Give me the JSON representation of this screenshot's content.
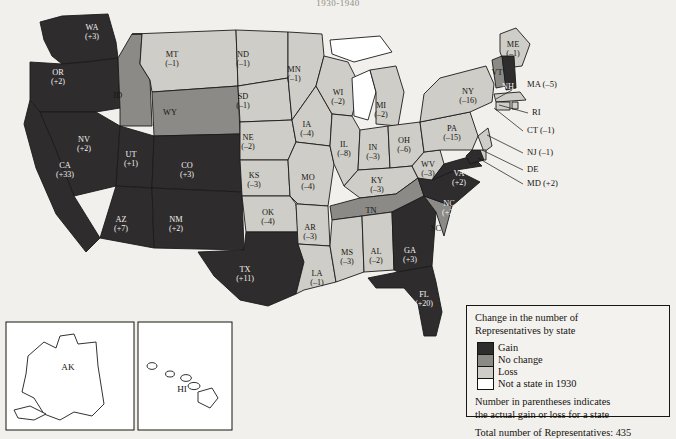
{
  "title": "1930-1940",
  "legend": {
    "heading_line1": "Change in the number of",
    "heading_line2": "Representatives by state",
    "items": [
      {
        "key": "gain",
        "label": "Gain",
        "color": "#2e2c2c"
      },
      {
        "key": "nochange",
        "label": "No change",
        "color": "#8b8a87"
      },
      {
        "key": "loss",
        "label": "Loss",
        "color": "#cfcdc8"
      },
      {
        "key": "notstate",
        "label": "Not a state in 1930",
        "color": "#ffffff"
      }
    ],
    "note_line1": "Number in parentheses indicates",
    "note_line2": "the actual gain or loss for a state",
    "total": "Total number of Representatives: 435"
  },
  "insets": [
    {
      "name": "AK",
      "label": "AK"
    },
    {
      "name": "HI",
      "label": "HI"
    }
  ],
  "chart_data": {
    "type": "map",
    "title": "Change in the number of Representatives by state",
    "total_representatives": 435,
    "categories": [
      "Gain",
      "No change",
      "Loss",
      "Not a state in 1930"
    ],
    "states": [
      {
        "code": "WA",
        "value": 3,
        "label": "WA",
        "num": "(+3)",
        "cat": "gain",
        "x": 92,
        "y": 30
      },
      {
        "code": "OR",
        "value": 2,
        "label": "OR",
        "num": "(+2)",
        "cat": "gain",
        "x": 58,
        "y": 75
      },
      {
        "code": "CA",
        "value": 33,
        "label": "CA",
        "num": "(+33)",
        "cat": "gain",
        "x": 65,
        "y": 168
      },
      {
        "code": "NV",
        "value": 2,
        "label": "NV",
        "num": "(+2)",
        "cat": "gain",
        "x": 84,
        "y": 142
      },
      {
        "code": "ID",
        "value": 0,
        "label": "ID",
        "num": "",
        "cat": "nochange",
        "x": 118,
        "y": 98
      },
      {
        "code": "MT",
        "value": -1,
        "label": "MT",
        "num": "(–1)",
        "cat": "loss",
        "x": 172,
        "y": 57
      },
      {
        "code": "WY",
        "value": 0,
        "label": "WY",
        "num": "",
        "cat": "nochange",
        "x": 170,
        "y": 115
      },
      {
        "code": "UT",
        "value": 1,
        "label": "UT",
        "num": "(+1)",
        "cat": "gain",
        "x": 131,
        "y": 157
      },
      {
        "code": "CO",
        "value": 3,
        "label": "CO",
        "num": "(+3)",
        "cat": "gain",
        "x": 187,
        "y": 168
      },
      {
        "code": "AZ",
        "value": 7,
        "label": "AZ",
        "num": "(+7)",
        "cat": "gain",
        "x": 121,
        "y": 222
      },
      {
        "code": "NM",
        "value": 2,
        "label": "NM",
        "num": "(+2)",
        "cat": "gain",
        "x": 176,
        "y": 222
      },
      {
        "code": "ND",
        "value": -1,
        "label": "ND",
        "num": "(–1)",
        "cat": "loss",
        "x": 243,
        "y": 57
      },
      {
        "code": "SD",
        "value": -1,
        "label": "SD",
        "num": "(–1)",
        "cat": "loss",
        "x": 243,
        "y": 99
      },
      {
        "code": "NE",
        "value": -2,
        "label": "NE",
        "num": "(–2)",
        "cat": "loss",
        "x": 248,
        "y": 140
      },
      {
        "code": "KS",
        "value": -3,
        "label": "KS",
        "num": "(–3)",
        "cat": "loss",
        "x": 254,
        "y": 178
      },
      {
        "code": "OK",
        "value": -4,
        "label": "OK",
        "num": "(–4)",
        "cat": "loss",
        "x": 268,
        "y": 215
      },
      {
        "code": "TX",
        "value": 11,
        "label": "TX",
        "num": "(+11)",
        "cat": "gain",
        "x": 245,
        "y": 272
      },
      {
        "code": "MN",
        "value": -1,
        "label": "MN",
        "num": "(–1)",
        "cat": "loss",
        "x": 294,
        "y": 72
      },
      {
        "code": "IA",
        "value": -4,
        "label": "IA",
        "num": "(–4)",
        "cat": "loss",
        "x": 307,
        "y": 127
      },
      {
        "code": "MO",
        "value": -4,
        "label": "MO",
        "num": "(–4)",
        "cat": "loss",
        "x": 308,
        "y": 180
      },
      {
        "code": "AR",
        "value": -3,
        "label": "AR",
        "num": "(–3)",
        "cat": "loss",
        "x": 310,
        "y": 230
      },
      {
        "code": "LA",
        "value": -1,
        "label": "LA",
        "num": "(–1)",
        "cat": "loss",
        "x": 317,
        "y": 276
      },
      {
        "code": "WI",
        "value": -2,
        "label": "WI",
        "num": "(–2)",
        "cat": "loss",
        "x": 338,
        "y": 95
      },
      {
        "code": "MI",
        "value": -2,
        "label": "MI",
        "num": "(–2)",
        "cat": "loss",
        "x": 381,
        "y": 108
      },
      {
        "code": "IL",
        "value": -8,
        "label": "IL",
        "num": "(–8)",
        "cat": "loss",
        "x": 344,
        "y": 147
      },
      {
        "code": "IN",
        "value": -3,
        "label": "IN",
        "num": "(–3)",
        "cat": "loss",
        "x": 373,
        "y": 150
      },
      {
        "code": "OH",
        "value": -6,
        "label": "OH",
        "num": "(–6)",
        "cat": "loss",
        "x": 404,
        "y": 143
      },
      {
        "code": "KY",
        "value": -3,
        "label": "KY",
        "num": "(–3)",
        "cat": "loss",
        "x": 377,
        "y": 183
      },
      {
        "code": "TN",
        "value": 0,
        "label": "TN",
        "num": "",
        "cat": "nochange",
        "x": 371,
        "y": 213
      },
      {
        "code": "MS",
        "value": -3,
        "label": "MS",
        "num": "(–3)",
        "cat": "loss",
        "x": 347,
        "y": 255
      },
      {
        "code": "AL",
        "value": -2,
        "label": "AL",
        "num": "(–2)",
        "cat": "loss",
        "x": 376,
        "y": 254
      },
      {
        "code": "GA",
        "value": 3,
        "label": "GA",
        "num": "(+3)",
        "cat": "gain",
        "x": 410,
        "y": 253
      },
      {
        "code": "FL",
        "value": 20,
        "label": "FL",
        "num": "(+20)",
        "cat": "gain",
        "x": 424,
        "y": 297
      },
      {
        "code": "SC",
        "value": 0,
        "label": "SC",
        "num": "",
        "cat": "nochange",
        "x": 436,
        "y": 231
      },
      {
        "code": "NC",
        "value": 2,
        "label": "NC",
        "num": "(+2)",
        "cat": "gain",
        "x": 449,
        "y": 206
      },
      {
        "code": "WV",
        "value": -3,
        "label": "WV",
        "num": "(–3)",
        "cat": "loss",
        "x": 428,
        "y": 167
      },
      {
        "code": "VA",
        "value": 2,
        "label": "VA",
        "num": "(+2)",
        "cat": "gain",
        "x": 459,
        "y": 176
      },
      {
        "code": "PA",
        "value": -15,
        "label": "PA",
        "num": "(–15)",
        "cat": "loss",
        "x": 452,
        "y": 131
      },
      {
        "code": "NY",
        "value": -16,
        "label": "NY",
        "num": "(–16)",
        "cat": "loss",
        "x": 468,
        "y": 94
      },
      {
        "code": "ME",
        "value": -1,
        "label": "ME",
        "num": "(–1)",
        "cat": "loss",
        "x": 513,
        "y": 47
      },
      {
        "code": "VT",
        "value": 0,
        "label": "VT",
        "num": "",
        "cat": "nochange",
        "x": 497,
        "y": 75
      },
      {
        "code": "NH",
        "value": 0,
        "label": "NH",
        "num": "",
        "cat": "gain",
        "x": 508,
        "y": 89
      }
    ],
    "callouts": [
      {
        "code": "MA",
        "label": "MA (–5)",
        "value": -5,
        "tx": 527,
        "ty": 87,
        "lx": 512,
        "ly": 90,
        "px": 496,
        "py": 99
      },
      {
        "code": "RI",
        "label": "RI",
        "value": null,
        "tx": 532,
        "ty": 115,
        "lx": 528,
        "ly": 113,
        "px": 499,
        "py": 105
      },
      {
        "code": "CT",
        "label": "CT (–1)",
        "value": -1,
        "tx": 527,
        "ty": 133,
        "lx": 523,
        "ly": 131,
        "px": 494,
        "py": 108
      },
      {
        "code": "NJ",
        "label": "NJ (–1)",
        "value": -1,
        "tx": 527,
        "ty": 155,
        "lx": 523,
        "ly": 153,
        "px": 487,
        "py": 135
      },
      {
        "code": "DE",
        "label": "DE",
        "value": null,
        "tx": 527,
        "ty": 172,
        "lx": 523,
        "ly": 170,
        "px": 482,
        "py": 150
      },
      {
        "code": "MD",
        "label": "MD (+2)",
        "value": 2,
        "tx": 527,
        "ty": 186,
        "lx": 523,
        "ly": 184,
        "px": 478,
        "py": 158
      }
    ]
  }
}
